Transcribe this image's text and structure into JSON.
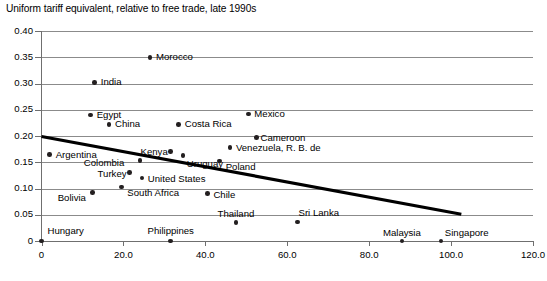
{
  "chart_data": {
    "type": "scatter",
    "title": "Uniform tariff equivalent, relative to free trade, late 1990s",
    "xlabel": "",
    "ylabel": "",
    "xlim": [
      0,
      120
    ],
    "ylim": [
      0,
      0.4
    ],
    "grid": "horizontal",
    "legend": "none",
    "xticks": [
      "0",
      "20.0",
      "40.0",
      "60.0",
      "80.0",
      "100.0",
      "120.0"
    ],
    "xtick_values": [
      0,
      20,
      40,
      60,
      80,
      100,
      120
    ],
    "yticks": [
      "0",
      "0.05",
      "0.10",
      "0.15",
      "0.20",
      "0.25",
      "0.30",
      "0.35",
      "0.40"
    ],
    "ytick_values": [
      0,
      0.05,
      0.1,
      0.15,
      0.2,
      0.25,
      0.3,
      0.35,
      0.4
    ],
    "points": [
      {
        "label": "Morocco",
        "x": 26.5,
        "y": 0.35,
        "lx": 6,
        "ly": -5
      },
      {
        "label": "India",
        "x": 13.0,
        "y": 0.302,
        "lx": 6,
        "ly": -5
      },
      {
        "label": "Egypt",
        "x": 12.0,
        "y": 0.24,
        "lx": 6,
        "ly": -5
      },
      {
        "label": "Mexico",
        "x": 50.5,
        "y": 0.242,
        "lx": 6,
        "ly": -5
      },
      {
        "label": "China",
        "x": 16.5,
        "y": 0.222,
        "lx": 6,
        "ly": -5
      },
      {
        "label": "Costa Rica",
        "x": 33.5,
        "y": 0.222,
        "lx": 6,
        "ly": -5
      },
      {
        "label": "Cameroon",
        "x": 52.5,
        "y": 0.197,
        "lx": 4,
        "ly": -5
      },
      {
        "label": "Venezuela, R. B. de",
        "x": 46.0,
        "y": 0.178,
        "lx": 6,
        "ly": -5
      },
      {
        "label": "Argentina",
        "x": 2.0,
        "y": 0.165,
        "lx": 6,
        "ly": -4
      },
      {
        "label": "Kenya",
        "x": 31.5,
        "y": 0.17,
        "lx": -33,
        "ly": -5
      },
      {
        "label": "Uruguay",
        "x": 34.5,
        "y": 0.163,
        "lx": 4,
        "ly": 4
      },
      {
        "label": "Poland",
        "x": 43.5,
        "y": 0.152,
        "lx": 6,
        "ly": 1
      },
      {
        "label": "Colombia",
        "x": 24.0,
        "y": 0.153,
        "lx": -45,
        "ly": -3
      },
      {
        "label": "Turkey",
        "x": 21.5,
        "y": 0.13,
        "lx": -33,
        "ly": -4
      },
      {
        "label": "United States",
        "x": 24.5,
        "y": 0.12,
        "lx": 6,
        "ly": -4
      },
      {
        "label": "South Africa",
        "x": 19.5,
        "y": 0.103,
        "lx": 6,
        "ly": 1
      },
      {
        "label": "Bolivia",
        "x": 12.5,
        "y": 0.092,
        "lx": -37,
        "ly": 0
      },
      {
        "label": "Chile",
        "x": 40.5,
        "y": 0.09,
        "lx": 6,
        "ly": -4
      },
      {
        "label": "Thailand",
        "x": 47.5,
        "y": 0.035,
        "lx": 0,
        "ly": -14
      },
      {
        "label": "Sri Lanka",
        "x": 62.5,
        "y": 0.036,
        "lx": 1,
        "ly": -14
      },
      {
        "label": "Hungary",
        "x": 0.0,
        "y": 0.0,
        "lx": 6,
        "ly": -15
      },
      {
        "label": "Philippines",
        "x": 31.5,
        "y": 0.0,
        "lx": 0,
        "ly": -15
      },
      {
        "label": "Malaysia",
        "x": 88.0,
        "y": 0.0,
        "lx": 0,
        "ly": -13
      },
      {
        "label": "Singapore",
        "x": 97.5,
        "y": 0.0,
        "lx": 4,
        "ly": -13
      }
    ],
    "trendline": {
      "x_start": 0.0,
      "y_start": 0.199,
      "x_end": 102.5,
      "y_end": 0.051
    }
  },
  "colors": {
    "marker": "#231f20",
    "gridline": "#8b8b8b",
    "axis": "#6f6f6f",
    "trendline": "#000000",
    "background": "#ffffff",
    "text": "#000000"
  }
}
